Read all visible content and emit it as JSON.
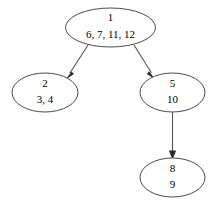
{
  "diagram": {
    "type": "tree",
    "title": "",
    "background_color": "#ffffff",
    "node_fill_color": "#ffffff",
    "node_stroke_color": "#4a4a4a",
    "edge_color": "#555555",
    "text_color": "#000000",
    "nodes": [
      {
        "id": "node-1",
        "label_top": "1",
        "label_bottom": "6, 7, 11, 12",
        "cx": 110.5,
        "cy": 27.5,
        "rx": 45,
        "ry": 19.5
      },
      {
        "id": "node-2",
        "label_top": "2",
        "label_bottom": "3, 4",
        "cx": 45,
        "cy": 92.5,
        "rx": 33,
        "ry": 19.5
      },
      {
        "id": "node-5",
        "label_top": "5",
        "label_bottom": "10",
        "cx": 172.5,
        "cy": 92.5,
        "rx": 32.5,
        "ry": 19.5
      },
      {
        "id": "node-8",
        "label_top": "8",
        "label_bottom": "9",
        "cx": 172.5,
        "cy": 177.5,
        "rx": 32.5,
        "ry": 19.5
      }
    ],
    "edges": [
      {
        "id": "edge-1-2",
        "from": "node-1",
        "to": "node-2",
        "x1": 88,
        "y1": 45,
        "x2": 68,
        "y2": 76,
        "arrow": true
      },
      {
        "id": "edge-1-5",
        "from": "node-1",
        "to": "node-5",
        "x1": 134,
        "y1": 45,
        "x2": 152,
        "y2": 76,
        "arrow": true
      },
      {
        "id": "edge-5-8",
        "from": "node-5",
        "to": "node-8",
        "x1": 172.5,
        "y1": 112,
        "x2": 172.5,
        "y2": 157,
        "arrow": true
      }
    ]
  }
}
